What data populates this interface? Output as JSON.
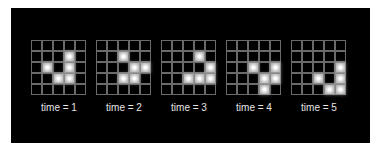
{
  "diagram": {
    "grid_size": 5,
    "frames": [
      {
        "label": "time = 1",
        "cells": [
          [
            1,
            3
          ],
          [
            2,
            1
          ],
          [
            2,
            3
          ],
          [
            3,
            2
          ],
          [
            3,
            3
          ]
        ]
      },
      {
        "label": "time = 2",
        "cells": [
          [
            1,
            2
          ],
          [
            2,
            3
          ],
          [
            2,
            4
          ],
          [
            3,
            2
          ],
          [
            3,
            3
          ]
        ]
      },
      {
        "label": "time = 3",
        "cells": [
          [
            1,
            3
          ],
          [
            2,
            4
          ],
          [
            3,
            2
          ],
          [
            3,
            3
          ],
          [
            3,
            4
          ]
        ]
      },
      {
        "label": "time = 4",
        "cells": [
          [
            2,
            2
          ],
          [
            2,
            4
          ],
          [
            3,
            3
          ],
          [
            3,
            4
          ],
          [
            4,
            3
          ]
        ]
      },
      {
        "label": "time = 5",
        "cells": [
          [
            2,
            4
          ],
          [
            3,
            2
          ],
          [
            3,
            4
          ],
          [
            4,
            3
          ],
          [
            4,
            4
          ]
        ]
      }
    ]
  },
  "colors": {
    "background": "#000000",
    "grid_line": "#6a6a6a",
    "live_cell": "#ffffff",
    "label": "#e6e6e6"
  }
}
